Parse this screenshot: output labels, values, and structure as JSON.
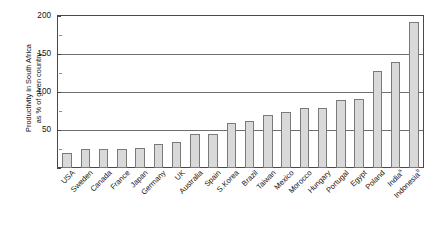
{
  "chart_data": {
    "type": "bar",
    "title": "",
    "xlabel": "",
    "ylabel": "Productivity in South Africa as % of given country",
    "ylabel_lines": [
      "Productivity in South Africa",
      "as % of given country"
    ],
    "ylim": [
      0,
      200
    ],
    "yticks": [
      0,
      50,
      100,
      150,
      200
    ],
    "ytick_labels": [
      "",
      "50",
      "100",
      "150",
      "200"
    ],
    "yminor_ticks": [
      25,
      75,
      125,
      175
    ],
    "grid": "horizontal",
    "legend": "none",
    "bar_color": "#d9d9d9",
    "bar_edge_color": "#7a7a7a",
    "axis_color": "#4a4a4a",
    "categories": [
      "USA",
      "Sweden",
      "Canada",
      "France",
      "Japan",
      "Germany",
      "UK",
      "Australia",
      "Spain",
      "S.Korea",
      "Brazil",
      "Taiwan",
      "Mexico",
      "Morocco",
      "Hungary",
      "Portugal",
      "Egypt",
      "Poland",
      "India",
      "Indonesia"
    ],
    "category_footnotes": [
      "",
      "",
      "",
      "",
      "",
      "",
      "",
      "",
      "",
      "",
      "",
      "",
      "",
      "",
      "",
      "",
      "",
      "",
      "a",
      "b"
    ],
    "values": [
      20,
      25,
      25,
      25,
      26,
      32,
      34,
      45,
      45,
      59,
      62,
      70,
      74,
      79,
      79,
      90,
      91,
      128,
      140,
      178
    ],
    "values_full": [
      20,
      25,
      25,
      25,
      26,
      32,
      34,
      45,
      45,
      59,
      62,
      70,
      74,
      79,
      79,
      90,
      91,
      128,
      140,
      178,
      192
    ],
    "note": "Bars ascend from USA (lowest) to Indonesia (highest)."
  },
  "series_final": {
    "bars": [
      {
        "label": "USA",
        "value": 20,
        "footnote": ""
      },
      {
        "label": "Sweden",
        "value": 25,
        "footnote": ""
      },
      {
        "label": "Canada",
        "value": 25,
        "footnote": ""
      },
      {
        "label": "France",
        "value": 25,
        "footnote": ""
      },
      {
        "label": "Japan",
        "value": 26,
        "footnote": ""
      },
      {
        "label": "Germany",
        "value": 32,
        "footnote": ""
      },
      {
        "label": "UK",
        "value": 34,
        "footnote": ""
      },
      {
        "label": "Australia",
        "value": 45,
        "footnote": ""
      },
      {
        "label": "Spain",
        "value": 45,
        "footnote": ""
      },
      {
        "label": "S.Korea",
        "value": 59,
        "footnote": ""
      },
      {
        "label": "Brazil",
        "value": 62,
        "footnote": ""
      },
      {
        "label": "Taiwan",
        "value": 70,
        "footnote": ""
      },
      {
        "label": "Mexico",
        "value": 74,
        "footnote": ""
      },
      {
        "label": "Morocco",
        "value": 79,
        "footnote": ""
      },
      {
        "label": "Hungary",
        "value": 79,
        "footnote": ""
      },
      {
        "label": "Portugal",
        "value": 90,
        "footnote": ""
      },
      {
        "label": "Egypt",
        "value": 91,
        "footnote": ""
      },
      {
        "label": "Poland",
        "value": 128,
        "footnote": ""
      },
      {
        "label": "India",
        "value": 140,
        "footnote": "a"
      },
      {
        "label": "Indonesia",
        "value": 192,
        "footnote": "b"
      }
    ]
  }
}
